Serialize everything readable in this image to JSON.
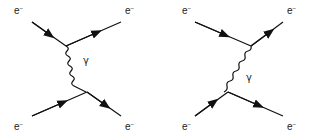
{
  "diagrams": [
    {
      "name": "t-channel",
      "labels": {
        "top_left": "e",
        "top_right": "e",
        "bottom_left": "e",
        "bottom_right": "e",
        "charge": "−",
        "boson": "γ"
      }
    },
    {
      "name": "u-channel",
      "labels": {
        "top_left": "e",
        "top_right": "e",
        "bottom_left": "e",
        "bottom_right": "e",
        "charge": "−",
        "boson": "γ"
      }
    }
  ],
  "colors": {
    "line": "#111111",
    "text": "#222222",
    "background": "#ffffff"
  }
}
